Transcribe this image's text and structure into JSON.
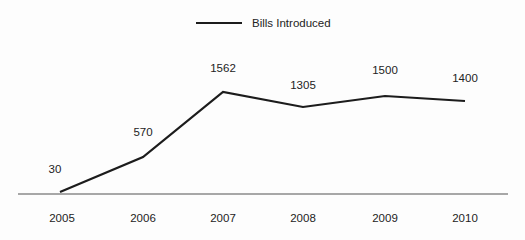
{
  "chart_data": {
    "type": "line",
    "title": "",
    "subtitle": "",
    "xlabel": "",
    "ylabel": "",
    "categories": [
      "2005",
      "2006",
      "2007",
      "2008",
      "2009",
      "2010"
    ],
    "series": [
      {
        "name": "Bills Introduced",
        "values": [
          30,
          570,
          1562,
          1305,
          1500,
          1400
        ],
        "color": "#1c1c1c"
      }
    ],
    "value_labels": [
      "30",
      "570",
      "1562",
      "1305",
      "1500",
      "1400"
    ],
    "ylim": [
      0,
      1700
    ],
    "grid": false,
    "legend": {
      "position": "top-center",
      "entries": [
        {
          "label": "Bills Introduced",
          "color": "#1c1c1c"
        }
      ]
    },
    "axis": {
      "x_axis_line": true,
      "y_axis_line": false,
      "axis_color": "#8a8a8a",
      "tick_labels": [
        "2005",
        "2006",
        "2007",
        "2008",
        "2009",
        "2010"
      ]
    }
  },
  "legend": {
    "label": "Bills Introduced"
  },
  "geometry": {
    "points": [
      {
        "x": 60,
        "y": 192,
        "label_x": 55,
        "label_y": 163
      },
      {
        "x": 143,
        "y": 157,
        "label_x": 143,
        "label_y": 126
      },
      {
        "x": 223,
        "y": 92,
        "label_x": 223,
        "label_y": 62
      },
      {
        "x": 303,
        "y": 107,
        "label_x": 303,
        "label_y": 79
      },
      {
        "x": 385,
        "y": 96,
        "label_x": 385,
        "label_y": 64
      },
      {
        "x": 465,
        "y": 101,
        "label_x": 465,
        "label_y": 72
      }
    ],
    "axis_y": 194,
    "axis_x_start": 18,
    "axis_x_end": 508
  }
}
